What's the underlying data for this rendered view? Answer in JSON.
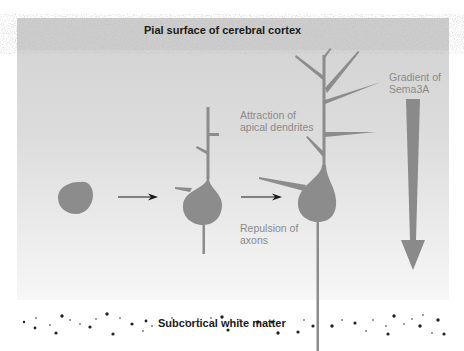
{
  "labels": {
    "pial_surface": "Pial surface of cerebral cortex",
    "white_matter": "Subcortical white matter",
    "attraction_line1": "Attraction of",
    "attraction_line2": "apical dendrites",
    "repulsion_line1": "Repulsion of",
    "repulsion_line2": "axons",
    "gradient_line1": "Gradient of",
    "gradient_line2": "Sema3A"
  },
  "stages": [
    {
      "name": "round-neuron",
      "description": "undifferentiated cell body"
    },
    {
      "name": "immature-pyramidal-neuron",
      "description": "early apical dendrite and axon"
    },
    {
      "name": "mature-pyramidal-neuron",
      "description": "branched apical dendrite and long axon"
    }
  ],
  "colors": {
    "cell": "#8c8c8c",
    "arrow": "#1a1a1a",
    "gradient_arrow": "#8a8a8a",
    "label_gray": "#8a8a8a",
    "background_top": "#cfcfcf",
    "background_bottom": "#ffffff",
    "dots": "#222222"
  }
}
